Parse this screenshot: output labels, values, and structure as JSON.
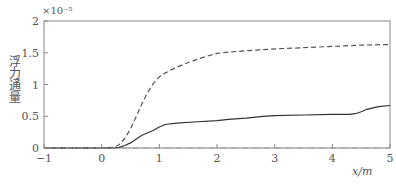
{
  "chart_data": {
    "type": "line",
    "title": "",
    "xlabel": "x/m",
    "ylabel": "浮力通量",
    "y_multiplier": "×10⁻⁵",
    "xlim": [
      -1,
      5
    ],
    "ylim": [
      0,
      2
    ],
    "x_ticks": [
      "-1",
      "0",
      "1",
      "2",
      "3",
      "4",
      "5"
    ],
    "y_ticks": [
      "0",
      "0.5",
      "1",
      "1.5",
      "2"
    ],
    "grid": false,
    "legend": "none",
    "series": [
      {
        "name": "dashed",
        "style": "dashed",
        "x": [
          -1,
          0,
          0.2,
          0.3,
          0.4,
          0.5,
          0.6,
          0.7,
          0.8,
          0.9,
          1.0,
          1.1,
          1.2,
          1.4,
          1.6,
          1.8,
          2.0,
          2.2,
          2.5,
          3.0,
          3.5,
          4.0,
          4.5,
          5.0
        ],
        "y": [
          0,
          0,
          0.01,
          0.05,
          0.15,
          0.3,
          0.5,
          0.7,
          0.88,
          1.02,
          1.12,
          1.18,
          1.23,
          1.31,
          1.38,
          1.44,
          1.49,
          1.51,
          1.53,
          1.56,
          1.58,
          1.6,
          1.62,
          1.63
        ]
      },
      {
        "name": "solid",
        "style": "solid",
        "x": [
          -1,
          0,
          0.2,
          0.3,
          0.4,
          0.5,
          0.6,
          0.7,
          0.8,
          0.9,
          1.0,
          1.1,
          1.3,
          1.6,
          2.0,
          2.2,
          2.5,
          2.8,
          3.0,
          3.5,
          4.0,
          4.3,
          4.4,
          4.5,
          4.6,
          4.8,
          5.0
        ],
        "y": [
          0,
          0,
          0.0,
          0.01,
          0.04,
          0.08,
          0.14,
          0.2,
          0.24,
          0.28,
          0.33,
          0.37,
          0.39,
          0.41,
          0.43,
          0.45,
          0.47,
          0.5,
          0.51,
          0.52,
          0.53,
          0.53,
          0.54,
          0.57,
          0.61,
          0.65,
          0.67
        ]
      },
      {
        "name": "dash-dot",
        "style": "dashdot",
        "x": [
          -1,
          0,
          1,
          2,
          3,
          4,
          5
        ],
        "y": [
          0,
          0,
          0,
          0,
          0,
          0,
          0
        ]
      }
    ]
  }
}
